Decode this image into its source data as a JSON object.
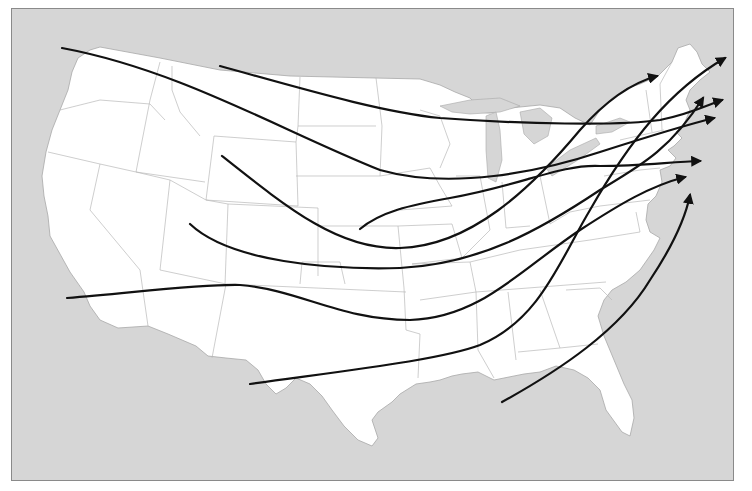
{
  "map": {
    "subject": "Continental United States",
    "theme": "Storm tracks converging on the Northeast",
    "colors": {
      "water": "#d6d6d6",
      "land": "#ffffff",
      "state_border": "#b9b9b9",
      "frame_border": "#8a8a8a",
      "track": "#111111"
    },
    "tracks": [
      {
        "id": "track-pacific-northwest",
        "origin": "Pacific Northwest coast",
        "destination": "Gulf of Maine",
        "has_arrow": true
      },
      {
        "id": "track-montana",
        "origin": "Northern Montana",
        "destination": "Maine coast",
        "has_arrow": true
      },
      {
        "id": "track-wyoming",
        "origin": "Wyoming",
        "destination": "Northern Maine / Canada",
        "has_arrow": true
      },
      {
        "id": "track-nebraska",
        "origin": "Nebraska",
        "destination": "Southern New England",
        "has_arrow": true
      },
      {
        "id": "track-colorado",
        "origin": "Colorado",
        "destination": "Massachusetts coast",
        "has_arrow": true
      },
      {
        "id": "track-southern-california",
        "origin": "Southern California",
        "destination": "New Jersey coast",
        "has_arrow": true
      },
      {
        "id": "track-texas",
        "origin": "West Texas",
        "destination": "Maine / Atlantic",
        "has_arrow": true
      },
      {
        "id": "track-gulf",
        "origin": "Gulf of Mexico",
        "destination": "Mid-Atlantic coast",
        "has_arrow": true
      }
    ]
  }
}
